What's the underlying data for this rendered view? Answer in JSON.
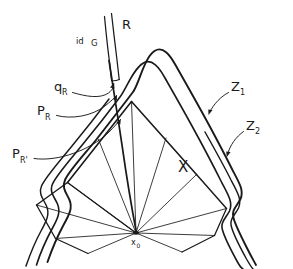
{
  "figure": {
    "title": "hand-drawn geometric diagram",
    "background_color": "#ffffff",
    "ink_color": "#1a1a1a"
  },
  "labels": {
    "ray_R": "R",
    "identity_G": "id",
    "group_G": "G",
    "q_R": "q",
    "q_R_sub": "R",
    "P_R": "P",
    "P_R_sub": "R",
    "P_R_prime": "P",
    "P_R_prime_sub": "R'",
    "Z1": "Z",
    "Z1_sub": "1",
    "Z2": "Z",
    "Z2_sub": "2",
    "X": "X",
    "basepoint": "x",
    "basepoint_sub": "0"
  },
  "elements": {
    "strip_label": "R-strip",
    "outer_contour": "Z1-contour",
    "middle_contour": "Z2-contour",
    "inner_contour": "inner-contour",
    "cone_region": "X-cone",
    "fan_rays_count": 11
  }
}
